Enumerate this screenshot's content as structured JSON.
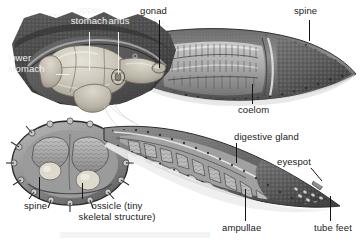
{
  "figure": {
    "width": 364,
    "height": 243,
    "background_color": "#ffffff"
  },
  "palette": {
    "paper": "#ffffff",
    "label_dark": "#1a1a1a",
    "label_light": "#f2f2f2",
    "disc_dark": "#4b4b4b",
    "disc_darker": "#3a3a3a",
    "arm_mid": "#6f6f6f",
    "arm_light": "#b9b9b9",
    "stomach_pale": "#d8d4c9",
    "stomach_shadow": "#a8a296",
    "gonad_gray": "#9a9a9a",
    "outline": "#2b2b2b"
  },
  "labels": [
    {
      "id": "upper-stomach",
      "text_lines": [
        "upper",
        "stomach"
      ],
      "text": "upper stomach",
      "style": "light",
      "x": 56,
      "y": 5,
      "align": "center",
      "leader": {
        "orientation": "vertical",
        "x": 89,
        "y": 32,
        "length": 39
      }
    },
    {
      "id": "anus",
      "text_lines": [
        "anus"
      ],
      "text": "anus",
      "style": "light",
      "x": 104,
      "y": 16,
      "align": "center",
      "leader": {
        "orientation": "vertical",
        "x": 118,
        "y": 32,
        "length": 42
      }
    },
    {
      "id": "gonad",
      "text_lines": [
        "gonad"
      ],
      "text": "gonad",
      "style": "dark",
      "x": 140,
      "y": 6,
      "align": "left",
      "leader": {
        "orientation": "vertical",
        "x": 159,
        "y": 20,
        "length": 48
      }
    },
    {
      "id": "spine-top",
      "text_lines": [
        "spine"
      ],
      "text": "spine",
      "style": "dark",
      "x": 294,
      "y": 6,
      "align": "left",
      "leader": {
        "orientation": "vertical",
        "x": 309,
        "y": 20,
        "length": 21
      }
    },
    {
      "id": "lower-stomach",
      "text_lines": [
        "lower",
        "stomach"
      ],
      "text": "lower stomach",
      "style": "light",
      "x": 8,
      "y": 52,
      "align": "left",
      "leader": {
        "orientation": "horizontal",
        "x": 56,
        "y": 74,
        "length": 14
      }
    },
    {
      "id": "coelom",
      "text_lines": [
        "coelom"
      ],
      "text": "coelom",
      "style": "dark",
      "x": 241,
      "y": 104,
      "align": "left",
      "leader": {
        "orientation": "vertical",
        "x": 252,
        "y": 84,
        "length": 20
      }
    },
    {
      "id": "digestive-gland",
      "text_lines": [
        "digestive gland"
      ],
      "text": "digestive gland",
      "style": "dark",
      "x": 234,
      "y": 132,
      "align": "left",
      "leader": {
        "orientation": "vertical",
        "x": 236,
        "y": 143,
        "length": 20
      }
    },
    {
      "id": "eyespot",
      "text_lines": [
        "eyespot"
      ],
      "text": "eyespot",
      "style": "dark",
      "x": 277,
      "y": 156,
      "align": "left",
      "leader": {
        "orientation": "diagonal",
        "x1": 311,
        "y1": 168,
        "x2": 321,
        "y2": 180
      }
    },
    {
      "id": "spine-lower",
      "text_lines": [
        "spine"
      ],
      "text": "spine",
      "style": "dark",
      "x": 27,
      "y": 200,
      "align": "left",
      "leader": {
        "orientation": "vertical",
        "x": 39,
        "y": 177,
        "length": 22
      }
    },
    {
      "id": "ossicle",
      "text_lines": [
        "ossicle (tiny",
        "skeletal structure)"
      ],
      "text": "ossicle (tiny skeletal structure)",
      "style": "dark",
      "x": 68,
      "y": 200,
      "align": "left",
      "leader": {
        "orientation": "vertical",
        "x": 82,
        "y": 183,
        "length": 16
      }
    },
    {
      "id": "ampullae",
      "text_lines": [
        "ampullae"
      ],
      "text": "ampullae",
      "style": "dark",
      "x": 222,
      "y": 222,
      "align": "left",
      "leader": {
        "orientation": "vertical",
        "x": 245,
        "y": 189,
        "length": 32
      }
    },
    {
      "id": "tube-feet",
      "text_lines": [
        "tube feet"
      ],
      "text": "tube feet",
      "style": "dark",
      "x": 318,
      "y": 222,
      "align": "left",
      "leader": {
        "orientation": "vertical",
        "x": 330,
        "y": 196,
        "length": 25
      }
    }
  ]
}
